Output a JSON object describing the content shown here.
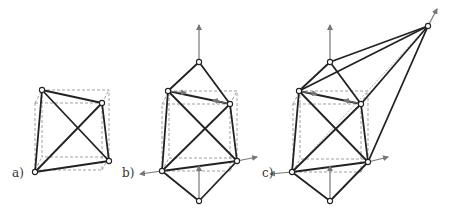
{
  "figure": {
    "panels": [
      {
        "id": "a",
        "label": "a)",
        "label_pos": [
          12,
          177
        ],
        "description": "tetrahedron inscribed in dashed cube",
        "cube": {
          "front": [
            35,
            103,
            102,
            170
          ],
          "back_offset": [
            7,
            -13
          ]
        },
        "vertices": [
          [
            42,
            90
          ],
          [
            102,
            103
          ],
          [
            109,
            161
          ],
          [
            35,
            172
          ]
        ],
        "edges": [
          [
            0,
            1
          ],
          [
            1,
            2
          ],
          [
            2,
            3
          ],
          [
            3,
            0
          ],
          [
            0,
            2
          ],
          [
            1,
            3
          ]
        ],
        "hidden_edges": [],
        "vectors": []
      },
      {
        "id": "b",
        "label": "b)",
        "label_pos": [
          122,
          177
        ],
        "description": "tetrahedron with two apex vertices and force vectors",
        "cube": {
          "front": [
            162,
            104,
            230,
            171
          ],
          "back_offset": [
            7,
            -13
          ]
        },
        "vertices": [
          [
            168,
            91
          ],
          [
            230,
            104
          ],
          [
            237,
            161
          ],
          [
            162,
            171
          ],
          [
            199,
            62
          ],
          [
            199,
            201
          ]
        ],
        "edges": [
          [
            0,
            1
          ],
          [
            1,
            2
          ],
          [
            2,
            3
          ],
          [
            3,
            0
          ],
          [
            0,
            2
          ],
          [
            1,
            3
          ],
          [
            4,
            0
          ],
          [
            4,
            1
          ],
          [
            5,
            2
          ],
          [
            5,
            3
          ]
        ],
        "hidden_edges": [],
        "vectors": [
          [
            [
              199,
              62
            ],
            [
              199,
              25
            ]
          ],
          [
            [
              168,
              91
            ],
            [
              186,
              93
            ]
          ],
          [
            [
              230,
              104
            ],
            [
              213,
              100
            ]
          ],
          [
            [
              162,
              171
            ],
            [
              140,
              174
            ]
          ],
          [
            [
              237,
              161
            ],
            [
              257,
              157
            ]
          ],
          [
            [
              199,
              201
            ],
            [
              199,
              166
            ]
          ]
        ]
      },
      {
        "id": "c",
        "label": "c)",
        "label_pos": [
          262,
          177
        ],
        "description": "extended structure with far apex and force vectors",
        "cube": {
          "front": [
            293,
            104,
            361,
            172
          ],
          "back_offset": [
            7,
            -13
          ]
        },
        "vertices": [
          [
            299,
            91
          ],
          [
            361,
            104
          ],
          [
            368,
            162
          ],
          [
            292,
            172
          ],
          [
            330,
            62
          ],
          [
            330,
            201
          ],
          [
            428,
            26
          ]
        ],
        "edges": [
          [
            0,
            1
          ],
          [
            1,
            2
          ],
          [
            2,
            3
          ],
          [
            3,
            0
          ],
          [
            0,
            2
          ],
          [
            1,
            3
          ],
          [
            4,
            0
          ],
          [
            4,
            1
          ],
          [
            5,
            2
          ],
          [
            5,
            3
          ],
          [
            6,
            4
          ],
          [
            6,
            0
          ],
          [
            6,
            1
          ],
          [
            6,
            2
          ]
        ],
        "hidden_edges": [
          [
            6,
            3
          ]
        ],
        "vectors": [
          [
            [
              330,
              62
            ],
            [
              330,
              25
            ]
          ],
          [
            [
              299,
              91
            ],
            [
              317,
              94
            ]
          ],
          [
            [
              361,
              104
            ],
            [
              344,
              100
            ]
          ],
          [
            [
              292,
              172
            ],
            [
              270,
              174
            ]
          ],
          [
            [
              368,
              162
            ],
            [
              388,
              157
            ]
          ],
          [
            [
              330,
              201
            ],
            [
              330,
              166
            ]
          ],
          [
            [
              428,
              26
            ],
            [
              437,
              9
            ]
          ]
        ]
      }
    ]
  },
  "colors": {
    "edge": "#222222",
    "cube": "#888888",
    "vector": "#777777",
    "background": "#ffffff"
  }
}
